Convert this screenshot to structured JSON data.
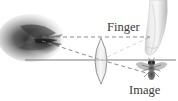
{
  "figure": {
    "kind": "optics-ray-diagram",
    "width": 178,
    "height": 101,
    "background_color": "#ffffff",
    "labels": {
      "finger": "Finger",
      "image": "Image"
    },
    "label_color": "#3a3a3a",
    "objects": {
      "magnified_blob": {
        "name": "magnified-blurred-fly",
        "description": "large dark blurred grayscale smudge at left, the enlarged blurred view",
        "bbox": [
          0,
          14,
          66,
          48
        ],
        "ink_color": "#2b2b2b"
      },
      "lens": {
        "name": "converging-lens",
        "description": "tall narrow biconvex lens drawn as vertical pointed oval",
        "center_x": 101,
        "top_y": 38,
        "bottom_y": 84,
        "half_width": 5,
        "outline_color": "#8a8a8a"
      },
      "finger": {
        "name": "fingertip",
        "description": "grayscale fingertip pointing downward at upper right",
        "bbox": [
          144,
          0,
          26,
          56
        ],
        "ink_color": "#9a9a9a"
      },
      "fly": {
        "name": "fly-insect",
        "description": "small grayscale fly with spread wings, head up, at lower right",
        "center_x": 151,
        "center_y": 71,
        "ink_color": "#6e6e6e"
      }
    },
    "lines": {
      "optical_axis": {
        "name": "optical-axis",
        "style": "solid",
        "color": "#6e6e6e",
        "x1": 25,
        "y1": 60,
        "x2": 176,
        "y2": 60
      },
      "upper_dashed": {
        "name": "upper-horizontal-dashed-ray",
        "style": "dashed",
        "color": "#7d7d7d",
        "x1": 42,
        "y1": 37,
        "x2": 150,
        "y2": 37
      },
      "ray_object_to_lens": {
        "name": "dashed-ray-blob-to-lens",
        "style": "dashed",
        "color": "#7d7d7d",
        "x1": 42,
        "y1": 41,
        "x2": 101,
        "y2": 60
      },
      "ray_lens_to_image": {
        "name": "dashed-ray-lens-to-fly",
        "style": "dashed",
        "color": "#7d7d7d",
        "x1": 101,
        "y1": 60,
        "x2": 150,
        "y2": 74
      },
      "ray_finger_to_lens": {
        "name": "dashed-ray-finger-to-lens",
        "style": "dashed",
        "color": "#7d7d7d",
        "x1": 101,
        "y1": 60,
        "x2": 150,
        "y2": 37
      }
    }
  }
}
